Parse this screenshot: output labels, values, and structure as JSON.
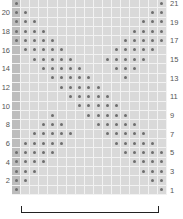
{
  "chart_data": {
    "type": "grid-pattern",
    "title": "",
    "columns": 17,
    "rows": 21,
    "shaded_column": 1,
    "colors": {
      "cell": "#d9d9d9",
      "shaded": "#bdbdbd",
      "dot": "#6e6e6e",
      "gridline": "#f2f2f2"
    },
    "left_row_labels": [
      "20",
      "18",
      "16",
      "14",
      "12",
      "10",
      "8",
      "6",
      "4",
      "2"
    ],
    "right_row_labels": [
      "21",
      "19",
      "17",
      "15",
      "13",
      "11",
      "9",
      "7",
      "5",
      "3",
      "1"
    ],
    "filled": {
      "21": [
        1,
        17
      ],
      "20": [
        1,
        2,
        16,
        17
      ],
      "19": [
        1,
        2,
        3,
        15,
        16,
        17
      ],
      "18": [
        1,
        2,
        3,
        4,
        14,
        15,
        16,
        17
      ],
      "17": [
        1,
        2,
        3,
        4,
        5,
        13,
        14,
        15,
        16,
        17
      ],
      "16": [
        2,
        3,
        4,
        5,
        6,
        12,
        13,
        14,
        15,
        16
      ],
      "15": [
        3,
        4,
        5,
        6,
        7,
        11,
        12,
        13,
        14,
        15
      ],
      "14": [
        4,
        5,
        6,
        7,
        8,
        12,
        13,
        14
      ],
      "13": [
        5,
        6,
        7,
        8,
        9,
        13
      ],
      "12": [
        6,
        7,
        8,
        9,
        10
      ],
      "11": [
        7,
        8,
        9,
        10,
        11
      ],
      "10": [
        8,
        9,
        10,
        11,
        12
      ],
      "9": [
        5,
        9,
        10,
        11,
        12,
        13
      ],
      "8": [
        4,
        5,
        6,
        10,
        11,
        12,
        13,
        14
      ],
      "7": [
        3,
        4,
        5,
        6,
        7,
        11,
        12,
        13,
        14,
        15
      ],
      "6": [
        2,
        3,
        4,
        5,
        6,
        12,
        13,
        14,
        15,
        16
      ],
      "5": [
        1,
        2,
        3,
        4,
        5,
        13,
        14,
        15,
        16,
        17
      ],
      "4": [
        1,
        2,
        3,
        4,
        14,
        15,
        16,
        17
      ],
      "3": [
        1,
        2,
        3,
        15,
        16,
        17
      ],
      "2": [
        1,
        2,
        16,
        17
      ],
      "1": [
        1,
        17
      ]
    },
    "bracket": "repeat bracket under columns 2-17"
  }
}
